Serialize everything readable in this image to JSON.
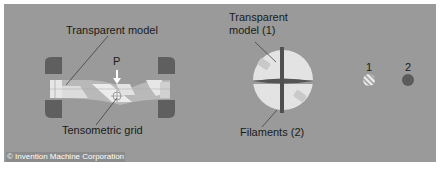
{
  "figure": {
    "labels": {
      "transparent_model": "Transparent model",
      "load_marker": "P",
      "tensometric_grid": "Tensometric grid",
      "transparent_model_1": "Transparent\nmodel (1)",
      "transparent_model_1_line1": "Transparent",
      "transparent_model_1_line2": "model (1)",
      "filaments": "Filaments (2)",
      "legend_1": "1",
      "legend_2": "2"
    },
    "credit": "© Invention Machine Corporation",
    "colors": {
      "background": "#999a99",
      "clamp": "#5e5f5e",
      "model_light": "#e8e8e8",
      "filament": "#4f504f",
      "legend_2": "#5a5b5a"
    }
  }
}
